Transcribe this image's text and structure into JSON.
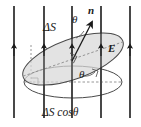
{
  "figure": {
    "name": "electric-flux-through-tilted-surface",
    "background_color": "#ffffff",
    "width": 141,
    "height": 127
  },
  "labels": {
    "delta_s": "ΔS",
    "theta_top": "θ",
    "normal_vector": "n",
    "field_label": "E",
    "theta_bottom": "θ",
    "projection": "ΔS cosθ"
  },
  "colors": {
    "line": "#1a1a1a",
    "stroke": "#4a4a4a",
    "surface_fill": "#d8d8d8",
    "dashed": "#8a8a8a",
    "text": "#1a1a1a"
  },
  "field_lines": {
    "count": 5,
    "direction": "upward",
    "x_positions": [
      14,
      44,
      72,
      101,
      130
    ],
    "y_top": 6,
    "y_bottom": 118,
    "arrow_y": 50
  },
  "surfaces": {
    "tilted": {
      "label_ref": "delta_s",
      "center_x": 73,
      "center_y": 59,
      "rx": 53,
      "ry": 20,
      "rotation_deg": -20,
      "fill": "#d8d8d8"
    },
    "projected": {
      "label_ref": "projection",
      "center_x": 73,
      "center_y": 82,
      "rx": 49,
      "ry": 16,
      "rotation_deg": 0,
      "fill": "none"
    }
  },
  "annotations": {
    "right_angle_normal": true,
    "right_angle_bottom": true,
    "right_angle_left": true,
    "angle_arc_top": true,
    "angle_arc_bottom": true
  }
}
